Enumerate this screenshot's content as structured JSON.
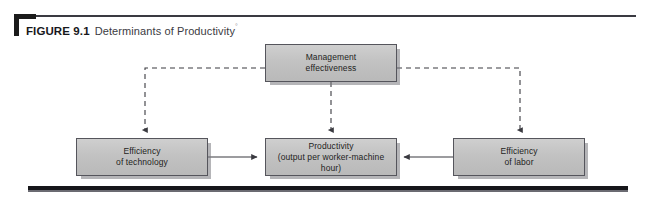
{
  "figure": {
    "label": "FIGURE 9.1",
    "title": "Determinants of Productivity",
    "superscript": "°"
  },
  "diagram": {
    "type": "flow-diagram",
    "nodes": [
      {
        "id": "management-effectiveness",
        "label": "Management\neffectiveness",
        "line1": "Management",
        "line2": "effectiveness"
      },
      {
        "id": "efficiency-of-technology",
        "label": "Efficiency\nof technology",
        "line1": "Efficiency",
        "line2": "of technology"
      },
      {
        "id": "productivity",
        "label": "Productivity\n(output per worker-machine hour)",
        "line1": "Productivity",
        "line2": "(output per worker-machine hour)"
      },
      {
        "id": "efficiency-of-labor",
        "label": "Efficiency\nof labor",
        "line1": "Efficiency",
        "line2": "of labor"
      }
    ],
    "edges": [
      {
        "from": "management-effectiveness",
        "to": "efficiency-of-technology",
        "style": "dashed",
        "arrow": true
      },
      {
        "from": "management-effectiveness",
        "to": "productivity",
        "style": "dashed",
        "arrow": true
      },
      {
        "from": "management-effectiveness",
        "to": "efficiency-of-labor",
        "style": "dashed",
        "arrow": true
      },
      {
        "from": "efficiency-of-technology",
        "to": "productivity",
        "style": "solid",
        "arrow": true
      },
      {
        "from": "efficiency-of-labor",
        "to": "productivity",
        "style": "solid",
        "arrow": true
      }
    ]
  },
  "colors": {
    "box_fill": "#c6c6c6",
    "box_border": "#55555c",
    "rule_dark": "#16161a",
    "text": "#1e1e22",
    "connector": "#3a3a40"
  }
}
